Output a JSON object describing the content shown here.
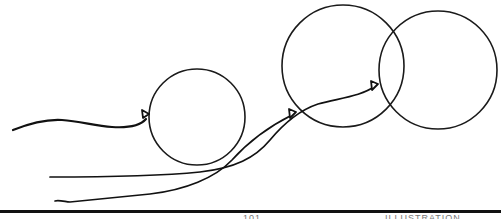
{
  "illustration": {
    "subject": "Three balloons on strings, line drawing",
    "balloons": [
      {
        "id": "small",
        "label": "small-balloon"
      },
      {
        "id": "middle",
        "label": "middle-balloon"
      },
      {
        "id": "right",
        "label": "right-balloon"
      }
    ],
    "colors": {
      "line": "#111111",
      "background": "#ffffff"
    }
  },
  "footer": {
    "page_marker": "101",
    "right_marker": "ILLUSTRATION"
  }
}
